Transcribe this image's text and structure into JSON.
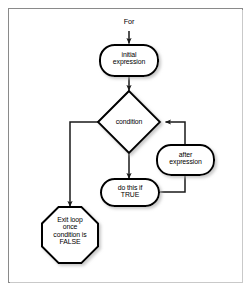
{
  "figure": {
    "background_color": "#ffffff",
    "frame_color": "#8a8a8a",
    "shape_fill": "#ffffff",
    "shape_stroke": "#000000",
    "connector_color": "#1a1a1a",
    "shadow_color": "#9a9a9a"
  },
  "entry": {
    "label": "For"
  },
  "nodes": [
    {
      "id": "initial-expression",
      "shape": "rounded-rectangle",
      "label": "initial\nexpression",
      "lines": [
        "initial",
        "expression"
      ]
    },
    {
      "id": "condition",
      "shape": "diamond",
      "label": "condition",
      "lines": [
        "condition"
      ]
    },
    {
      "id": "after-expression",
      "shape": "rounded-rectangle",
      "label": "after\nexpression",
      "lines": [
        "after",
        "expression"
      ]
    },
    {
      "id": "do-this-if-true",
      "shape": "rounded-rectangle",
      "label": "do this if\nTRUE",
      "lines": [
        "do this if",
        "TRUE"
      ]
    },
    {
      "id": "exit-loop",
      "shape": "octagon",
      "label": "Exit loop\nonce\ncondition is\nFALSE",
      "lines": [
        "Exit loop",
        "once",
        "condition is",
        "FALSE"
      ]
    }
  ],
  "connectors": [
    {
      "id": "for-to-initial",
      "from": "For",
      "to": "initial expression",
      "arrow": true
    },
    {
      "id": "initial-to-condition",
      "from": "initial expression",
      "to": "condition",
      "arrow": true
    },
    {
      "id": "condition-to-do-this",
      "from": "condition",
      "to": "do this if TRUE",
      "arrow": true
    },
    {
      "id": "condition-to-exit",
      "from": "condition",
      "to": "Exit loop once condition is FALSE",
      "arrow": true
    },
    {
      "id": "do-this-to-after",
      "from": "do this if TRUE",
      "to": "after expression",
      "arrow": false
    },
    {
      "id": "after-to-condition",
      "from": "after expression",
      "to": "condition",
      "arrow": true
    }
  ]
}
